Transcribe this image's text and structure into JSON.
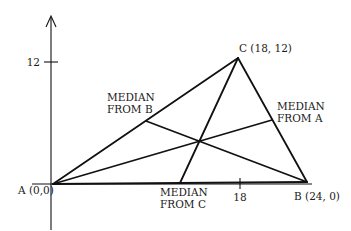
{
  "diagram": {
    "vertices": [
      {
        "name": "A",
        "label": "A (0,0)",
        "x": 0,
        "y": 0
      },
      {
        "name": "B",
        "label": "B (24, 0)",
        "x": 24,
        "y": 0
      },
      {
        "name": "C",
        "label": "C (18, 12)",
        "x": 18,
        "y": 12
      }
    ],
    "axis_ticks": {
      "y": [
        {
          "value": 12,
          "label": "12"
        }
      ],
      "x": [
        {
          "value": 18,
          "label": "18"
        }
      ]
    },
    "medians": [
      {
        "from": "A",
        "to_midpoint_of": "BC",
        "label_line1": "MEDIAN",
        "label_line2": "FROM A"
      },
      {
        "from": "B",
        "to_midpoint_of": "AC",
        "label_line1": "MEDIAN",
        "label_line2": "FROM B"
      },
      {
        "from": "C",
        "to_midpoint_of": "AB",
        "label_line1": "MEDIAN",
        "label_line2": "FROM C"
      }
    ]
  }
}
